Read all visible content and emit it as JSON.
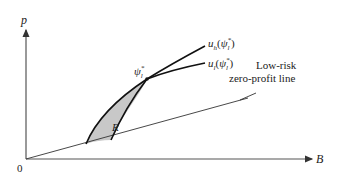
{
  "diagram": {
    "axes": {
      "y_label": "p",
      "x_label": "B",
      "origin_label": "0"
    },
    "curves": {
      "uh": {
        "base": "u",
        "sub": "h",
        "arg_base": "ψ",
        "arg_sub": "l",
        "arg_sup": "*"
      },
      "ul": {
        "base": "u",
        "sub": "l",
        "arg_base": "ψ",
        "arg_sub": "l",
        "arg_sup": "*"
      }
    },
    "point": {
      "base": "ψ",
      "sub": "l",
      "sup": "*"
    },
    "region": {
      "label": "R",
      "fill": "#c8c8c8"
    },
    "line": {
      "label_line1": "Low-risk",
      "label_line2": "zero-profit line"
    },
    "colors": {
      "axis": "#555555",
      "curve": "#111111",
      "line": "#333333"
    }
  }
}
